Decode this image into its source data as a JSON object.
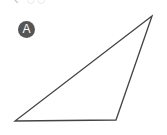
{
  "top_fragment": "‹  ◌◌",
  "label": {
    "text": "A",
    "bg_color": "#555555",
    "text_color": "#ffffff"
  },
  "triangle": {
    "vertices": [
      [
        152,
        16
      ],
      [
        15,
        121
      ],
      [
        116,
        120
      ]
    ],
    "stroke": "#444444",
    "fill": "none"
  }
}
